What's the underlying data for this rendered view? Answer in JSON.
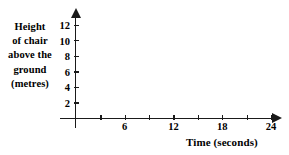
{
  "chart_data": {
    "type": "scatter",
    "title": "",
    "subtitle": "",
    "xlabel": "Time (seconds)",
    "ylabel_lines": [
      "Height",
      "of chair",
      "above the",
      "ground",
      "(metres)"
    ],
    "ylabel": "Height of chair above the ground (metres)",
    "xlim": [
      0,
      27
    ],
    "ylim": [
      0,
      13
    ],
    "x_major_ticklabels": [
      "6",
      "12",
      "18",
      "24"
    ],
    "x_major_values": [
      6,
      12,
      18,
      24
    ],
    "x_minor_values": [
      3,
      9,
      15,
      21
    ],
    "x_tick_values": [
      3,
      6,
      9,
      12,
      15,
      18,
      21,
      24
    ],
    "y_ticklabels": [
      "2",
      "4",
      "6",
      "8",
      "10",
      "12"
    ],
    "y_tick_values": [
      2,
      4,
      6,
      8,
      10,
      12
    ],
    "series": [
      {
        "name": "height of chair",
        "x": [],
        "y": []
      }
    ],
    "grid": false,
    "legend": null,
    "annotations": [],
    "axis_color": "#1a1a1a",
    "text_color": "#000000",
    "background": "#ffffff",
    "x_axis_arrow": true,
    "y_axis_arrow": true
  }
}
